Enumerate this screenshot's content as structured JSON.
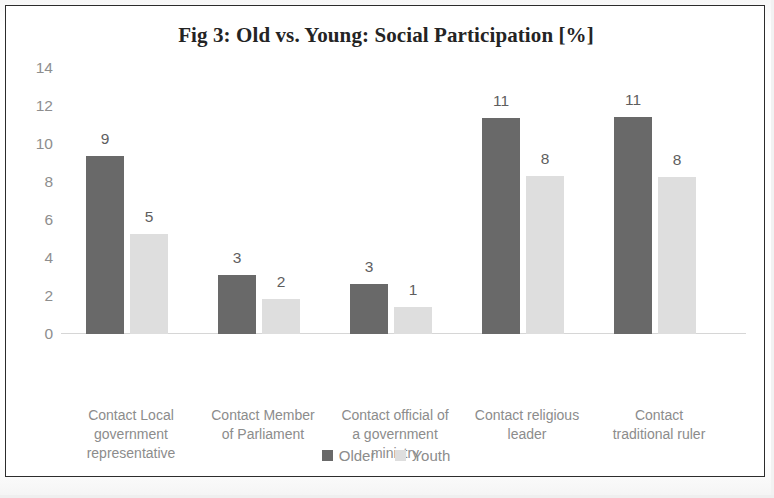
{
  "chart_data": {
    "type": "bar",
    "title": "Fig 3: Old vs. Young: Social Participation [%]",
    "xlabel": "",
    "ylabel": "",
    "ylim": [
      0,
      14
    ],
    "yticks": [
      0,
      2,
      4,
      6,
      8,
      10,
      12,
      14
    ],
    "grid": false,
    "legend_position": "bottom-center",
    "categories": [
      "Contact Local government representative",
      "Contact Member of Parliament",
      "Contact official of a government ministry",
      "Contact religious leader",
      "Contact traditional ruler"
    ],
    "category_lines": [
      [
        "Contact Local",
        "government",
        "representative"
      ],
      [
        "Contact Member",
        "of Parliament"
      ],
      [
        "Contact official of",
        "a government",
        "ministry"
      ],
      [
        "Contact religious",
        "leader"
      ],
      [
        "Contact",
        "traditional ruler"
      ]
    ],
    "series": [
      {
        "name": "Older",
        "color": "#696969",
        "values": [
          9,
          3,
          3,
          11,
          11
        ],
        "plotted": [
          9.35,
          3.1,
          2.65,
          11.35,
          11.4
        ]
      },
      {
        "name": "Youth",
        "color": "#dedede",
        "values": [
          5,
          2,
          1,
          8,
          8
        ],
        "plotted": [
          5.25,
          1.85,
          1.4,
          8.3,
          8.25
        ]
      }
    ]
  },
  "legend": {
    "items": [
      {
        "label": "Older",
        "color": "#696969"
      },
      {
        "label": "Youth",
        "color": "#dedede"
      }
    ]
  },
  "colors": {
    "older": "#696969",
    "youth": "#dedede",
    "title_text": "#242424",
    "tick_text": "#8e8e8e",
    "category_text": "#8c8c8c",
    "data_label_text": "#5e5e5e",
    "axis_line": "#d6d6d6",
    "frame_border": "#2c2c2c",
    "background": "#ffffff"
  }
}
